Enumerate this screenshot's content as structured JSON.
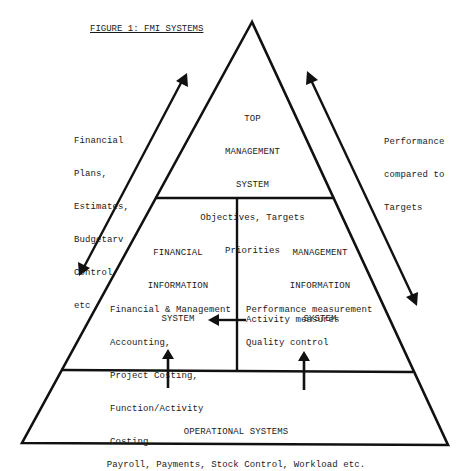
{
  "figure": {
    "title": "FIGURE 1: FMI SYSTEMS"
  },
  "left_flow": {
    "label_lines": [
      "Financial",
      "Plans,",
      "Estimates,",
      "Budgetarv",
      "Control",
      "etc"
    ]
  },
  "right_flow": {
    "label_lines": [
      "Performance",
      "compared to",
      "Targets"
    ]
  },
  "top_system": {
    "heading_lines": [
      "TOP",
      "MANAGEMENT",
      "SYSTEM"
    ],
    "detail_lines": [
      "Objectives, Targets",
      "Priorities"
    ]
  },
  "financial_system": {
    "heading_lines": [
      "FINANCIAL",
      "INFORMATION",
      "SYSTEM"
    ],
    "detail_lines": [
      "Financial & Management",
      "Accounting,",
      "Project Costing,",
      "Function/Activity",
      "Costing"
    ]
  },
  "management_system": {
    "heading_lines": [
      "MANAGEMENT",
      "INFORMATION",
      "SYSTEM"
    ],
    "detail_lines": [
      "Performance measurement",
      "Quality control"
    ],
    "activity_label": "Activity measures"
  },
  "operational_system": {
    "heading": "OPERATIONAL SYSTEMS",
    "detail": "Payroll, Payments, Stock Control, Workload etc."
  },
  "colors": {
    "line": "#111111",
    "text": "#1a1a1a",
    "background": "#ffffff"
  }
}
